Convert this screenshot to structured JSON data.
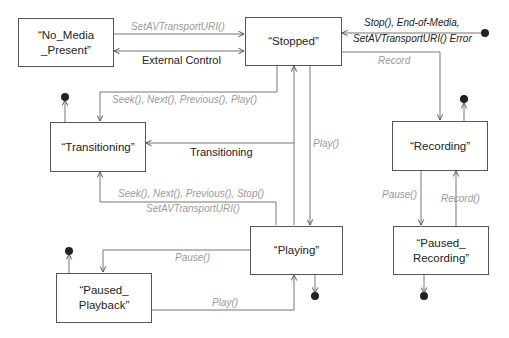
{
  "diagram": {
    "type": "state-machine",
    "states": [
      {
        "id": "no_media_present",
        "label": "“No_Media\n_Present”"
      },
      {
        "id": "stopped",
        "label": "“Stopped”"
      },
      {
        "id": "transitioning",
        "label": "“Transitioning”"
      },
      {
        "id": "recording",
        "label": "“Recording”"
      },
      {
        "id": "playing",
        "label": "“Playing”"
      },
      {
        "id": "paused_playback",
        "label": "“Paused_\nPlayback”"
      },
      {
        "id": "paused_recording",
        "label": "“Paused_\nRecording”"
      }
    ],
    "transitions": [
      {
        "from": "no_media_present",
        "to": "stopped",
        "label": "SetAVTransportURI()",
        "style": "gray-italic"
      },
      {
        "from": "no_media_present",
        "to": "stopped",
        "label": "External Control",
        "style": "plain",
        "bidirectional": true
      },
      {
        "from": "initial",
        "to": "stopped",
        "label_line1": "Stop(), End-of-Media,",
        "label_line2": "SetAVTransportURI() Error",
        "style": "dark-italic"
      },
      {
        "from": "stopped",
        "to": "recording",
        "label": "Record",
        "style": "gray-italic"
      },
      {
        "from": "stopped",
        "to": "transitioning",
        "label": "Seek(), Next(), Previous(), Play()",
        "style": "gray-italic"
      },
      {
        "from": "playing",
        "to": "transitioning",
        "label": "Transitioning",
        "style": "plain"
      },
      {
        "from": "stopped",
        "to": "playing",
        "label": "Play()",
        "style": "gray-italic"
      },
      {
        "from": "playing",
        "to": "stopped",
        "label": "",
        "style": "none"
      },
      {
        "from": "playing",
        "to": "transitioning",
        "label_line1": "Seek(), Next(), Previous(), Stop()",
        "label_line2": "SetAVTransportURI()",
        "style": "gray-italic"
      },
      {
        "from": "playing",
        "to": "paused_playback",
        "label": "Pause()",
        "style": "gray-italic"
      },
      {
        "from": "paused_playback",
        "to": "playing",
        "label": "Play()",
        "style": "gray-italic"
      },
      {
        "from": "recording",
        "to": "paused_recording",
        "label": "Pause()",
        "style": "gray-italic"
      },
      {
        "from": "paused_recording",
        "to": "recording",
        "label": "Record()",
        "style": "gray-italic"
      }
    ],
    "labels": {
      "set_uri": "SetAVTransportURI()",
      "external_control": "External Control",
      "stop_eom_1": "Stop(), End-of-Media,",
      "stop_eom_2": "SetAVTransportURI() Error",
      "record": "Record",
      "seek_play": "Seek(), Next(), Previous(), Play()",
      "transitioning": "Transitioning",
      "play_stopped": "Play()",
      "seek_stop_1": "Seek(), Next(), Previous(), Stop()",
      "seek_stop_2": "SetAVTransportURI()",
      "pause_playback": "Pause()",
      "play_paused": "Play()",
      "pause_recording": "Pause()",
      "record_resume": "Record()"
    }
  }
}
